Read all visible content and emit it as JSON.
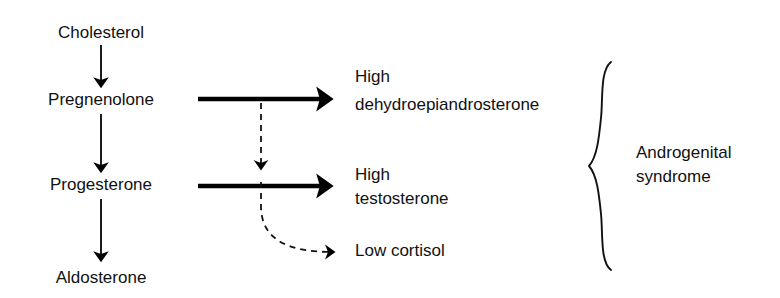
{
  "diagram": {
    "background_color": "#ffffff",
    "ink_color": "#111111",
    "pathway_nodes": [
      {
        "id": "cholesterol",
        "label": "Cholesterol",
        "x": 101,
        "y": 38
      },
      {
        "id": "pregnenolone",
        "label": "Pregnenolone",
        "x": 101,
        "y": 105
      },
      {
        "id": "progesterone",
        "label": "Progesterone",
        "x": 101,
        "y": 190
      },
      {
        "id": "aldosterone",
        "label": "Aldosterone",
        "x": 101,
        "y": 283
      }
    ],
    "outcomes": [
      {
        "id": "dhea",
        "line1": "High",
        "line2": "dehydroepiandrosterone",
        "x": 355,
        "y1": 82,
        "y2": 110,
        "arrow": "solid-bold"
      },
      {
        "id": "testosterone",
        "line1": "High",
        "line2": "testosterone",
        "x": 355,
        "y1": 180,
        "y2": 204,
        "arrow": "solid-bold"
      },
      {
        "id": "cortisol",
        "line1": "Low cortisol",
        "line2": "",
        "x": 355,
        "y1": 256,
        "y2": null,
        "arrow": "dashed"
      }
    ],
    "bracket": {
      "label_line1": "Androgenital",
      "label_line2": "syndrome",
      "label_x": 636,
      "label_y1": 158,
      "label_y2": 182,
      "top_y": 62,
      "bottom_y": 270,
      "tip_x": 620,
      "spine_x": 602
    },
    "vertical_arrows": [
      {
        "from": "cholesterol",
        "to": "pregnenolone",
        "x": 101,
        "y1": 45,
        "y2": 88
      },
      {
        "from": "pregnenolone",
        "to": "progesterone",
        "x": 101,
        "y1": 114,
        "y2": 173
      },
      {
        "from": "progesterone",
        "to": "aldosterone",
        "x": 101,
        "y1": 199,
        "y2": 262
      }
    ],
    "horizontal_arrows": [
      {
        "from": "pregnenolone",
        "to": "dhea",
        "x1": 198,
        "x2": 347,
        "y": 99
      },
      {
        "from": "progesterone",
        "to": "testosterone",
        "x1": 198,
        "x2": 347,
        "y": 186
      }
    ],
    "dashed_branch": {
      "from": "dhea-arrow",
      "via_x": 261,
      "start_y": 103,
      "mid_arrowhead_y": 175,
      "end_x": 345,
      "end_y": 252
    }
  }
}
